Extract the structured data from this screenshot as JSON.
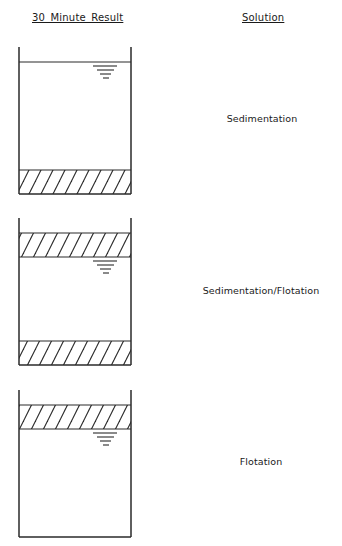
{
  "headers": {
    "left": "30 Minute Result",
    "right": "Solution"
  },
  "colors": {
    "line": "#2a2a2a",
    "background": "#ffffff"
  },
  "diagrams": [
    {
      "name": "sedimentation",
      "solution": "Sedimentation",
      "layers": [
        "water-surface",
        "liquid",
        "settled-sludge-bottom"
      ]
    },
    {
      "name": "sedimentation-flotation",
      "solution": "Sedimentation/Flotation",
      "layers": [
        "floating-sludge-top",
        "liquid",
        "settled-sludge-bottom"
      ]
    },
    {
      "name": "flotation",
      "solution": "Flotation",
      "layers": [
        "floating-sludge-top",
        "liquid"
      ]
    }
  ],
  "icons": {
    "water_level": "water-level-icon",
    "hatch": "hatched-sludge-layer"
  }
}
